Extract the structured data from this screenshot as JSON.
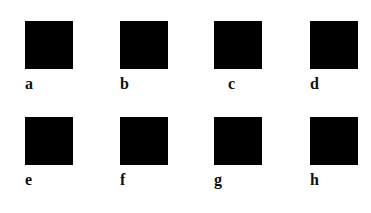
{
  "figure": {
    "background_color": "#ffffff",
    "swatch_color": "#000000",
    "label_color": "#101010",
    "rows": 2,
    "columns": 4,
    "swatch_width_px": 48,
    "swatch_height_px": 48,
    "panels": [
      {
        "id": "a",
        "label": "a",
        "row": 1,
        "column": 1,
        "x": 25,
        "y": 21,
        "fill": "#000000"
      },
      {
        "id": "b",
        "label": "b",
        "row": 1,
        "column": 2,
        "x": 120,
        "y": 21,
        "fill": "#000000"
      },
      {
        "id": "c",
        "label": "c",
        "row": 1,
        "column": 3,
        "x": 214,
        "y": 21,
        "fill": "#000000"
      },
      {
        "id": "d",
        "label": "d",
        "row": 1,
        "column": 4,
        "x": 310,
        "y": 21,
        "fill": "#000000"
      },
      {
        "id": "e",
        "label": "e",
        "row": 2,
        "column": 1,
        "x": 25,
        "y": 117,
        "fill": "#000000"
      },
      {
        "id": "f",
        "label": "f",
        "row": 2,
        "column": 2,
        "x": 120,
        "y": 117,
        "fill": "#000000"
      },
      {
        "id": "g",
        "label": "g",
        "row": 2,
        "column": 3,
        "x": 214,
        "y": 117,
        "fill": "#000000"
      },
      {
        "id": "h",
        "label": "h",
        "row": 2,
        "column": 4,
        "x": 310,
        "y": 117,
        "fill": "#000000"
      }
    ]
  }
}
